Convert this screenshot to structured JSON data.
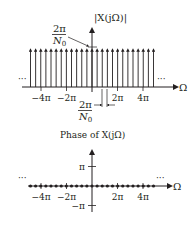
{
  "magnitude_plot": {
    "ylabel": "|X(jΩ)|",
    "xlabel": "Ω",
    "impulse_height_label_num": "2π",
    "impulse_height_label_den": "N",
    "impulse_height_label_sub": "0",
    "spacing_label_num": "2π",
    "spacing_label_den": "N",
    "spacing_label_sub": "0",
    "ticks": [
      {
        "label": "−4π",
        "value_pi": -4
      },
      {
        "label": "−2π",
        "value_pi": -2
      },
      {
        "label": "2π",
        "value_pi": 2
      },
      {
        "label": "4π",
        "value_pi": 4
      }
    ],
    "ellipsis_left": "···",
    "ellipsis_right": "···",
    "impulse_count": 25
  },
  "phase_plot": {
    "title": "Phase of X(jΩ)",
    "xlabel": "Ω",
    "yticks": [
      {
        "label": "π",
        "value_pi": 1
      },
      {
        "label": "−π",
        "value_pi": -1
      }
    ],
    "xticks": [
      {
        "label": "−4π",
        "value_pi": -4
      },
      {
        "label": "−2π",
        "value_pi": -2
      },
      {
        "label": "2π",
        "value_pi": 2
      },
      {
        "label": "4π",
        "value_pi": 4
      }
    ],
    "ellipsis_left": "···",
    "ellipsis_right": "···",
    "dot_count": 25,
    "phase_value": 0
  },
  "colors": {
    "ink": "#231f20"
  }
}
